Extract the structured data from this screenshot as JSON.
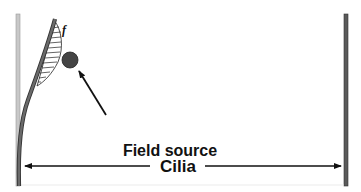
{
  "diagram": {
    "labels": {
      "force": "f",
      "field_source": "Field source",
      "cilia": "Cilia"
    },
    "colors": {
      "background": "#ffffff",
      "left_wall": "#c8c8c8",
      "right_wall": "#5a5a5a",
      "cilium": "#555555",
      "field_source": "#444444",
      "arrow": "#111111",
      "text": "#111111"
    }
  }
}
